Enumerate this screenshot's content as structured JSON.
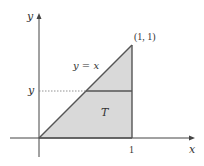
{
  "diagram": {
    "axes": {
      "x_label": "x",
      "y_label": "y"
    },
    "region": {
      "label": "T",
      "fill": "#d9d9d9",
      "stroke": "#555555"
    },
    "curve_label": "y = x",
    "point_label": "(1, 1)",
    "x_tick_label": "1",
    "y_level_label": "y",
    "colors": {
      "axis": "#444444",
      "dotted": "#777777"
    }
  }
}
